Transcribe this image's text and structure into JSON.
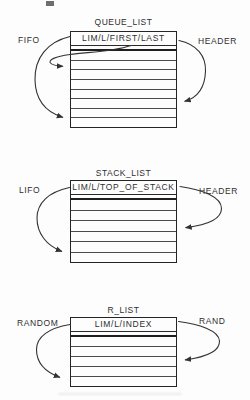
{
  "figure": {
    "ink_color": "#2e2e2e",
    "background_color": "#fdfdfd",
    "diagrams": [
      {
        "title": "QUEUE_LIST",
        "header_cell": "LIM/L/FIRST/LAST",
        "left_label": "FIFO",
        "right_label": "HEADER",
        "row_count": 8
      },
      {
        "title": "STACK_LIST",
        "header_cell": "LIM/L/TOP_OF_STACK",
        "left_label": "LIFO",
        "right_label": "HEADER",
        "row_count": 6
      },
      {
        "title": "R_LIST",
        "header_cell": "LIM/L/INDEX",
        "left_label": "RANDOM",
        "right_label": "RAND",
        "row_count": 5
      }
    ]
  }
}
